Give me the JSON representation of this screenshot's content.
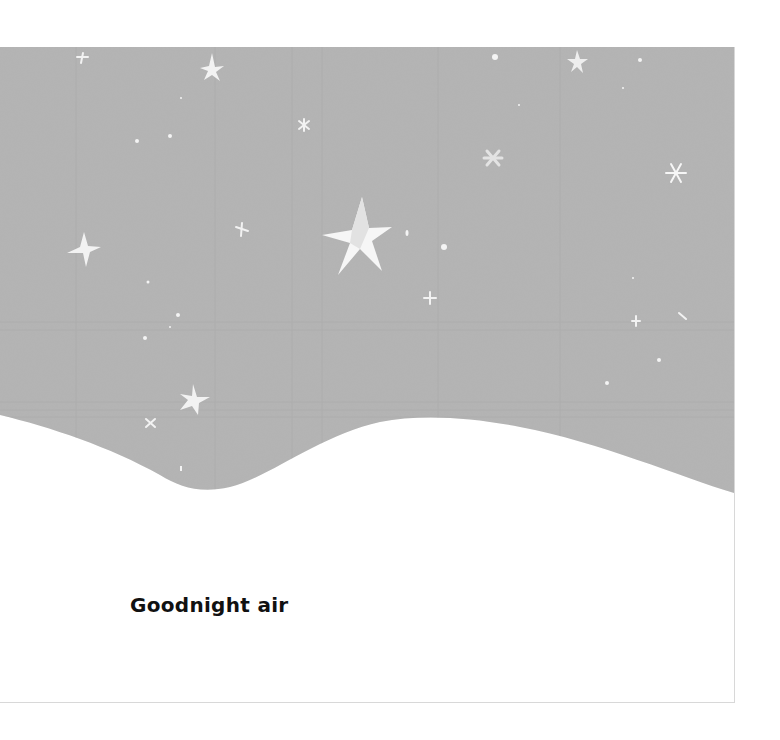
{
  "page": {
    "caption": "Goodnight air",
    "sky_color": "#b3b3b3",
    "star_color": "#f4f4f4",
    "icons": [
      "star-icon",
      "sparkle-icon"
    ]
  }
}
